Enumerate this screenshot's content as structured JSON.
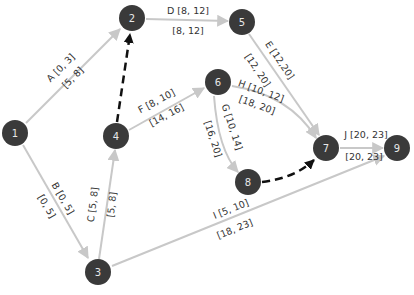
{
  "diagram": {
    "type": "activity-network",
    "nodes": [
      {
        "id": "1",
        "x": 15,
        "y": 133
      },
      {
        "id": "2",
        "x": 132,
        "y": 18
      },
      {
        "id": "3",
        "x": 98,
        "y": 272
      },
      {
        "id": "4",
        "x": 116,
        "y": 136
      },
      {
        "id": "5",
        "x": 242,
        "y": 22
      },
      {
        "id": "6",
        "x": 218,
        "y": 82
      },
      {
        "id": "7",
        "x": 326,
        "y": 148
      },
      {
        "id": "8",
        "x": 248,
        "y": 182
      },
      {
        "id": "9",
        "x": 397,
        "y": 148
      }
    ],
    "edges": [
      {
        "id": "A",
        "from": "1",
        "to": "2",
        "top": "A [0, 3]",
        "bottom": "[5, 8]"
      },
      {
        "id": "B",
        "from": "1",
        "to": "3",
        "top": "B [0, 5]",
        "bottom": "[0, 5]"
      },
      {
        "id": "C",
        "from": "3",
        "to": "4",
        "top": "C [5, 8]",
        "bottom": "[5, 8]"
      },
      {
        "id": "D",
        "from": "2",
        "to": "5",
        "top": "D [8, 12]",
        "bottom": "[8, 12]"
      },
      {
        "id": "E",
        "from": "5",
        "to": "7",
        "top": "E [12,20]",
        "bottom": "[12, 20]"
      },
      {
        "id": "F",
        "from": "4",
        "to": "6",
        "top": "F [8, 10]",
        "bottom": "[14, 16]"
      },
      {
        "id": "G",
        "from": "6",
        "to": "8",
        "top": "G [10, 14]",
        "bottom": "[16, 20]"
      },
      {
        "id": "H",
        "from": "6",
        "to": "7",
        "top": "H [10, 12]",
        "bottom": "[18, 20]"
      },
      {
        "id": "I",
        "from": "3",
        "to": "9",
        "top": "I [5, 10]",
        "bottom": "[18, 23]"
      },
      {
        "id": "J",
        "from": "7",
        "to": "9",
        "top": "J [20, 23]",
        "bottom": "[20, 23]"
      }
    ],
    "dummy_edges": [
      {
        "from": "4",
        "to": "2"
      },
      {
        "from": "8",
        "to": "7"
      }
    ],
    "colors": {
      "node": "#3a3a3a",
      "edge": "#c8c8c8",
      "dummy": "#111111"
    }
  }
}
